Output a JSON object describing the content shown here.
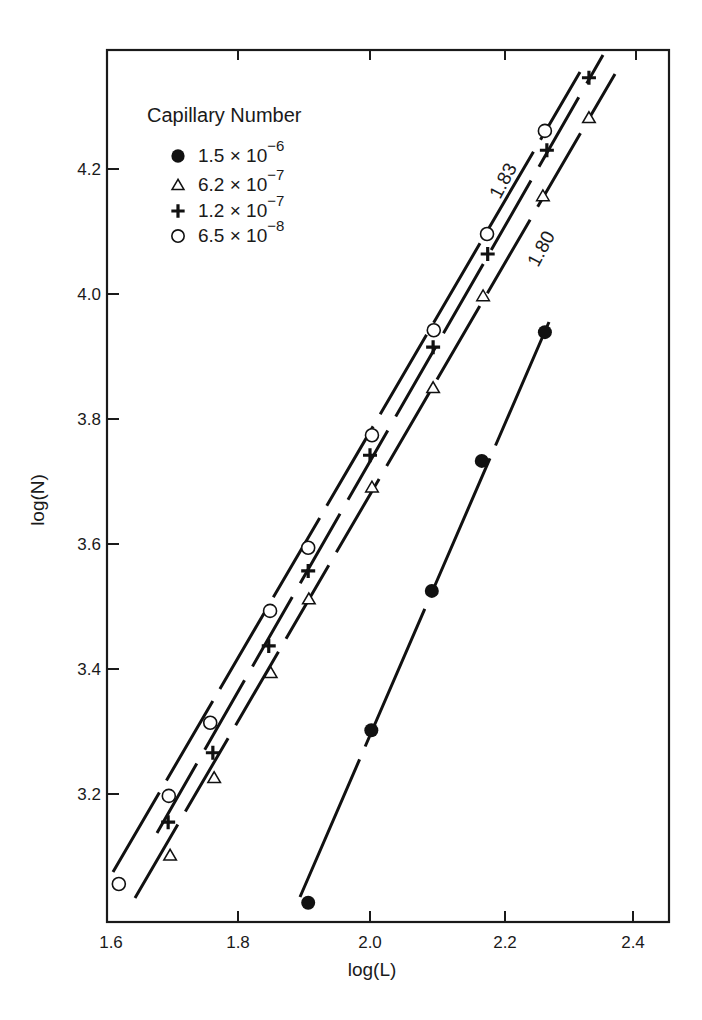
{
  "chart_data": {
    "type": "scatter",
    "title": "",
    "xlabel": "log(L)",
    "ylabel": "log(N)",
    "xlim": [
      1.6,
      2.45
    ],
    "ylim": [
      3.0,
      4.38
    ],
    "xticks": [
      "1.6",
      "1.8",
      "2.0",
      "2.2",
      "2.4"
    ],
    "yticks": [
      "3.2",
      "3.4",
      "3.6",
      "3.8",
      "4.0",
      "4.2"
    ],
    "grid": false,
    "legend": {
      "title": "Capillary Number",
      "position": "upper-left",
      "entries": [
        {
          "marker": "filled-circle",
          "mantissa": "1.5 × 10",
          "exponent": "−6"
        },
        {
          "marker": "open-triangle",
          "mantissa": "6.2 × 10",
          "exponent": "−7"
        },
        {
          "marker": "plus",
          "mantissa": "1.2 × 10",
          "exponent": "−7"
        },
        {
          "marker": "open-circle",
          "mantissa": "6.5 × 10",
          "exponent": "−8"
        }
      ]
    },
    "annotations": [
      {
        "text": "1.83",
        "note": "slope label for upper fitted lines"
      },
      {
        "text": "1.80",
        "note": "slope label for triangle fitted line"
      }
    ],
    "series": [
      {
        "name": "1.5 × 10^-6",
        "marker": "filled-circle",
        "x": [
          1.906,
          2.002,
          2.094,
          2.17,
          2.266
        ],
        "y": [
          3.026,
          3.302,
          3.525,
          3.733,
          3.939
        ]
      },
      {
        "name": "6.2 × 10^-7",
        "marker": "open-triangle",
        "x": [
          1.696,
          1.763,
          1.849,
          1.907,
          2.003,
          2.096,
          2.172,
          2.263,
          2.333
        ],
        "y": [
          3.102,
          3.226,
          3.394,
          3.512,
          3.691,
          3.85,
          3.997,
          4.157,
          4.282
        ]
      },
      {
        "name": "1.2 × 10^-7",
        "marker": "plus",
        "x": [
          1.693,
          1.761,
          1.846,
          1.906,
          2.0,
          2.096,
          2.179,
          2.269,
          2.333
        ],
        "y": [
          3.155,
          3.266,
          3.437,
          3.557,
          3.742,
          3.915,
          4.064,
          4.23,
          4.346
        ]
      },
      {
        "name": "6.5 × 10^-8",
        "marker": "open-circle",
        "x": [
          1.618,
          1.694,
          1.757,
          1.848,
          1.906,
          2.003,
          2.097,
          2.178,
          2.266
        ],
        "y": [
          3.056,
          3.197,
          3.314,
          3.493,
          3.594,
          3.774,
          3.942,
          4.096,
          4.261
        ]
      }
    ]
  }
}
